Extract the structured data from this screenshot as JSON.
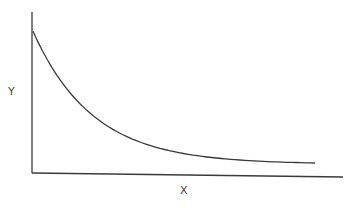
{
  "chart_data": {
    "type": "line",
    "title": "",
    "xlabel": "X",
    "ylabel": "Y",
    "grid": false,
    "legend": null,
    "ticks": {
      "x": [],
      "y": []
    },
    "xlim": [
      0,
      1
    ],
    "ylim": [
      0,
      1
    ],
    "series": [
      {
        "name": "curve",
        "color": "#3a3a3a",
        "x": [
          0.0,
          0.09,
          0.19,
          0.32,
          0.48,
          0.64,
          0.91
        ],
        "y": [
          0.88,
          0.57,
          0.36,
          0.2,
          0.12,
          0.08,
          0.06
        ]
      }
    ]
  },
  "colors": {
    "axis": "#3a3a3a",
    "curve": "#3a3a3a",
    "background": "#ffffff"
  }
}
